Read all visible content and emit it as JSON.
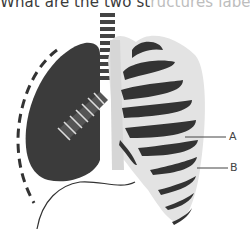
{
  "question": {
    "visible_text": "What are the two st",
    "faded_text": "ructures labelled"
  },
  "diagram": {
    "labels": [
      {
        "id": "A",
        "text": "A"
      },
      {
        "id": "B",
        "text": "B"
      }
    ],
    "colors": {
      "lung": "#3b3b3b",
      "ribcage": "#e3e3e3",
      "rib": "#333333",
      "line": "#333333"
    }
  }
}
